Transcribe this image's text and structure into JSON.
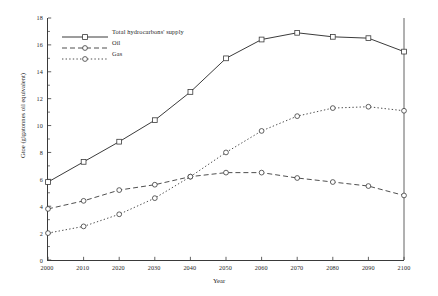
{
  "chart_data": {
    "type": "line",
    "title": "",
    "xlabel": "Year",
    "ylabel": "Gtoe (gigatonnes oil equivalent)",
    "x": [
      2000,
      2010,
      2020,
      2030,
      2040,
      2050,
      2060,
      2070,
      2080,
      2090,
      2100
    ],
    "xlim": [
      2000,
      2100
    ],
    "ylim": [
      0,
      18
    ],
    "yticks": [
      0,
      2,
      4,
      6,
      8,
      10,
      12,
      14,
      16,
      18
    ],
    "xticks": [
      2000,
      2010,
      2020,
      2030,
      2040,
      2050,
      2060,
      2070,
      2080,
      2090,
      2100
    ],
    "grid": false,
    "legend_position": "upper-left",
    "series": [
      {
        "name": "Total hydrocarbons' supply",
        "linestyle": "solid",
        "marker": "square-open",
        "values": [
          5.8,
          7.3,
          8.8,
          10.4,
          12.5,
          15.0,
          16.4,
          16.9,
          16.6,
          16.5,
          15.5
        ]
      },
      {
        "name": "Oil",
        "linestyle": "dashed",
        "marker": "circle-open",
        "values": [
          3.8,
          4.4,
          5.2,
          5.6,
          6.2,
          6.5,
          6.5,
          6.1,
          5.8,
          5.5,
          4.8
        ]
      },
      {
        "name": "Gas",
        "linestyle": "dotted",
        "marker": "circle-open",
        "values": [
          2.0,
          2.5,
          3.4,
          4.6,
          6.2,
          8.0,
          9.6,
          10.7,
          11.3,
          11.4,
          11.1
        ]
      }
    ]
  },
  "axis": {
    "xtick_labels": [
      "2000",
      "2010",
      "2020",
      "2030",
      "2040",
      "2050",
      "2060",
      "2070",
      "2080",
      "2090",
      "2100"
    ],
    "ytick_labels": [
      "0",
      "2",
      "4",
      "6",
      "8",
      "10",
      "12",
      "14",
      "16",
      "18"
    ],
    "xlabel": "Year",
    "ylabel": "Gtoe (gigatonnes oil equivalent)"
  },
  "legend": {
    "items": [
      {
        "label": "Total hydrocarbons' supply"
      },
      {
        "label": "Oil"
      },
      {
        "label": "Gas"
      }
    ]
  },
  "colors": {
    "line": "#3a3a3a",
    "axis": "#3a3a3a",
    "text": "#1f1f1f",
    "background": "#ffffff"
  }
}
